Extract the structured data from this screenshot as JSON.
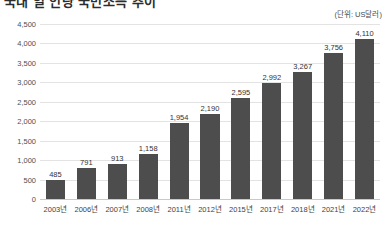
{
  "chart_data": {
    "type": "bar",
    "title": "국내 일 인당 국민소득 추이",
    "unit_label": "(단위: US달러)",
    "categories": [
      "2003년",
      "2006년",
      "2007년",
      "2008년",
      "2011년",
      "2012년",
      "2015년",
      "2017년",
      "2018년",
      "2021년",
      "2022년"
    ],
    "values": [
      485,
      791,
      913,
      1158,
      1954,
      2190,
      2595,
      2992,
      3267,
      3756,
      4110
    ],
    "value_labels": [
      "485",
      "791",
      "913",
      "1,158",
      "1,954",
      "2,190",
      "2,595",
      "2,992",
      "3,267",
      "3,756",
      "4,110"
    ],
    "xlabel": "",
    "ylabel": "",
    "ylim": [
      0,
      4500
    ],
    "ytick_values": [
      0,
      500,
      1000,
      1500,
      2000,
      2500,
      3000,
      3500,
      4000,
      4500
    ],
    "ytick_labels": [
      "0",
      "500",
      "1,000",
      "1,500",
      "2,000",
      "2,500",
      "3,000",
      "3,500",
      "4,000",
      "4,500"
    ],
    "grid": true,
    "legend": "none",
    "bar_color": "#4d4d4d",
    "gridline_color": "#e3e3e3",
    "text_color": "#3c3c3c"
  }
}
